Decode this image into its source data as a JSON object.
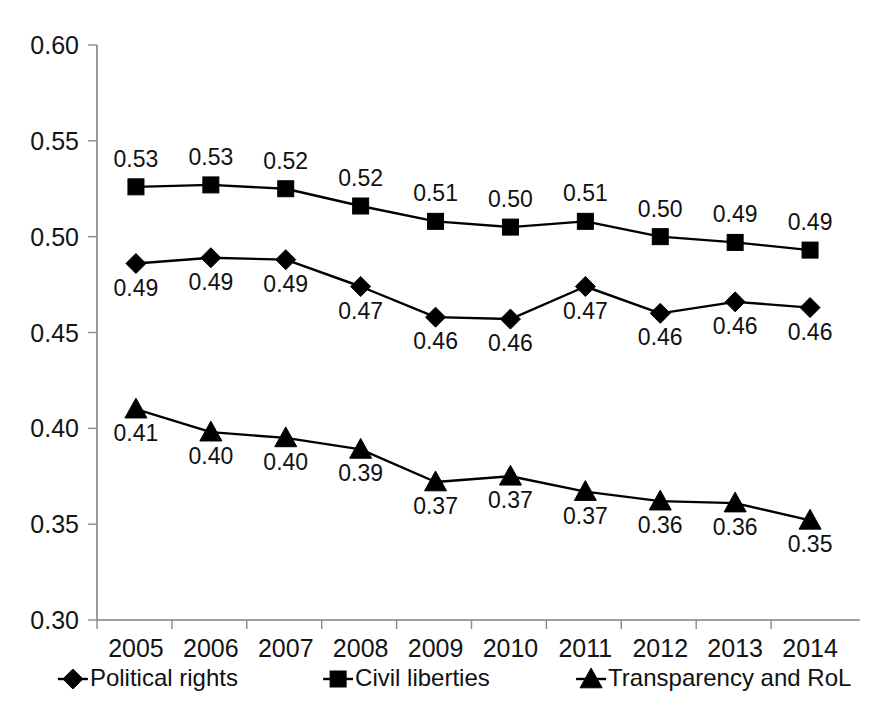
{
  "chart_data": {
    "type": "line",
    "title": "",
    "subtitle": "",
    "xlabel": "",
    "ylabel": "",
    "categories": [
      "2005",
      "2006",
      "2007",
      "2008",
      "2009",
      "2010",
      "2011",
      "2012",
      "2013",
      "2014"
    ],
    "ylim": [
      0.3,
      0.6
    ],
    "yticks": [
      "0.30",
      "0.35",
      "0.40",
      "0.45",
      "0.50",
      "0.55",
      "0.60"
    ],
    "ytick_values": [
      0.3,
      0.35,
      0.4,
      0.45,
      0.5,
      0.55,
      0.6
    ],
    "grid": false,
    "legend_position": "bottom",
    "series": [
      {
        "name": "Political rights",
        "marker": "diamond",
        "color": "#000000",
        "values": [
          0.486,
          0.489,
          0.488,
          0.474,
          0.458,
          0.457,
          0.474,
          0.46,
          0.466,
          0.463
        ],
        "labels": [
          "0.49",
          "0.49",
          "0.49",
          "0.47",
          "0.46",
          "0.46",
          "0.47",
          "0.46",
          "0.46",
          "0.46"
        ],
        "label_side": [
          "below",
          "below",
          "below",
          "below",
          "below",
          "below",
          "below",
          "below",
          "below",
          "below"
        ]
      },
      {
        "name": "Civil liberties",
        "marker": "square",
        "color": "#000000",
        "values": [
          0.526,
          0.527,
          0.525,
          0.516,
          0.508,
          0.505,
          0.508,
          0.5,
          0.497,
          0.493
        ],
        "labels": [
          "0.53",
          "0.53",
          "0.52",
          "0.52",
          "0.51",
          "0.50",
          "0.51",
          "0.50",
          "0.49",
          "0.49"
        ],
        "label_side": [
          "above",
          "above",
          "above",
          "above",
          "above",
          "above",
          "above",
          "above",
          "above",
          "above"
        ]
      },
      {
        "name": "Transparency and RoL",
        "marker": "triangle",
        "color": "#000000",
        "values": [
          0.41,
          0.398,
          0.395,
          0.389,
          0.372,
          0.375,
          0.367,
          0.362,
          0.361,
          0.352
        ],
        "labels": [
          "0.41",
          "0.40",
          "0.40",
          "0.39",
          "0.37",
          "0.37",
          "0.37",
          "0.36",
          "0.36",
          "0.35"
        ],
        "label_side": [
          "below",
          "below",
          "below",
          "below",
          "below",
          "below",
          "below",
          "below",
          "below",
          "below"
        ]
      }
    ]
  },
  "legend": {
    "items": [
      {
        "label": "Political rights",
        "marker": "diamond"
      },
      {
        "label": "Civil liberties",
        "marker": "square"
      },
      {
        "label": "Transparency and RoL",
        "marker": "triangle"
      }
    ]
  }
}
